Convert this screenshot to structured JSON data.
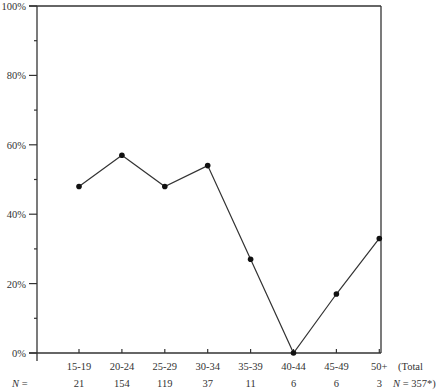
{
  "chart_data": {
    "type": "line",
    "title": "",
    "xlabel": "",
    "ylabel": "",
    "categories": [
      "15-19",
      "20-24",
      "25-29",
      "30-34",
      "35-39",
      "40-44",
      "45-49",
      "50+"
    ],
    "series": [
      {
        "name": "Percentage",
        "values": [
          48,
          57,
          48,
          54,
          27,
          0,
          17,
          33
        ]
      }
    ],
    "n_values": [
      21,
      154,
      119,
      37,
      11,
      6,
      6,
      3
    ],
    "n_label": "N =",
    "total_label_line1": "(Total",
    "total_label_line2": "N = 357*)",
    "total_n": 357,
    "ylim": [
      0,
      100
    ],
    "y_ticks": [
      "0%",
      "20%",
      "40%",
      "60%",
      "80%",
      "100%"
    ],
    "y_minor_ticks": [
      10,
      30,
      50,
      70,
      90
    ],
    "grid": false,
    "legend": "none"
  },
  "colors": {
    "line": "#333333",
    "marker": "#111111",
    "axis": "#333333"
  }
}
